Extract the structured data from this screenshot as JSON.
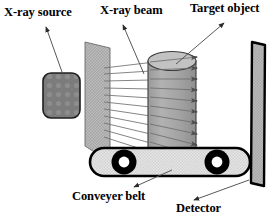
{
  "figure": {
    "width": 276,
    "height": 219,
    "background": "#ffffff"
  },
  "labels": {
    "xray_source": "X-ray source",
    "xray_beam": "X-ray beam",
    "target_object": "Target object",
    "conveyer_belt": "Conveyer belt",
    "detector": "Detector"
  },
  "components": {
    "source": {
      "name": "X-ray source",
      "shape": "rounded-rectangle",
      "fill": "#7c7c7c",
      "stroke": "#1a1a1a",
      "x": 43,
      "y": 73,
      "width": 36,
      "height": 44
    },
    "collimator": {
      "name": "Collimator plate",
      "shape": "quadrilateral",
      "fill": "#b4b4b4",
      "stroke": "#555555"
    },
    "target": {
      "name": "Target object",
      "shape": "cylinder",
      "fill": "#a8a8a8",
      "stroke": "#3c3c3c",
      "x": 148,
      "y": 52,
      "width": 48,
      "height": 104
    },
    "belt": {
      "name": "Conveyer belt",
      "shape": "rounded-band",
      "fill": "#e0e0e0",
      "stroke": "#000000",
      "x": 90,
      "y": 148,
      "width": 160,
      "height": 28,
      "rollers": 2,
      "roller_fill": "#000000",
      "roller_hub": "#ffffff"
    },
    "detector": {
      "name": "Detector",
      "shape": "tall-panel",
      "fill": "#b0b0b0",
      "stroke": "#000000",
      "x": 250,
      "y": 42,
      "width": 14,
      "height": 145
    },
    "beam": {
      "name": "X-ray beam",
      "ray_count": 11,
      "stroke": "#6b6b6b",
      "arrowheads": true
    }
  },
  "colors": {
    "ink": "#000000",
    "leader": "#555555",
    "source_fill": "#7c7c7c",
    "plate_fill": "#b4b4b4",
    "cylinder_fill": "#a8a8a8",
    "belt_fill": "#e0e0e0",
    "detector_fill": "#b0b0b0",
    "beam_line": "#6b6b6b"
  }
}
